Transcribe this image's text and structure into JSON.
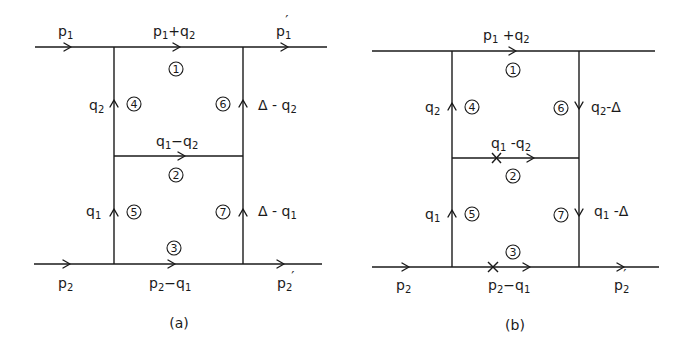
{
  "figure": {
    "type": "Feynman diagrams (two-loop ladder)",
    "panels": [
      {
        "id": "a",
        "caption": "(a)",
        "external_lines": {
          "top_in": {
            "base": "p",
            "sub": "1",
            "prime": ""
          },
          "top_out": {
            "base": "p",
            "sub": "1",
            "prime": "′"
          },
          "bottom_in": {
            "base": "p",
            "sub": "2",
            "prime": ""
          },
          "bottom_out": {
            "base": "p",
            "sub": "2",
            "prime": "′"
          }
        },
        "propagators": [
          {
            "number": "1",
            "label": "p₁+q₂",
            "direction": "right"
          },
          {
            "number": "2",
            "label": "q₁−q₂",
            "direction": "right"
          },
          {
            "number": "3",
            "label": "p₂−q₁",
            "direction": "right"
          },
          {
            "number": "4",
            "label": "q₂",
            "direction": "up"
          },
          {
            "number": "5",
            "label": "q₁",
            "direction": "up"
          },
          {
            "number": "6",
            "label": "Δ−q₂",
            "direction": "up"
          },
          {
            "number": "7",
            "label": "Δ−q₁",
            "direction": "up"
          }
        ],
        "labels": {
          "p1_base": "p",
          "p1_sub": "1",
          "p1p_base": "p",
          "p1p_sub": "1",
          "p1p_prime": "′",
          "top_mid_a": "p",
          "top_mid_a_sub": "1",
          "top_mid_op": "+q",
          "top_mid_b_sub": "2",
          "mid_a": "q",
          "mid_a_sub": "1",
          "mid_op": "−q",
          "mid_b_sub": "2",
          "bot_a": "p",
          "bot_a_sub": "2",
          "bot_op": "−q",
          "bot_b_sub": "1",
          "p2_base": "p",
          "p2_sub": "2",
          "p2p_base": "p",
          "p2p_sub": "2",
          "p2p_prime": "′",
          "left_top": "q",
          "left_top_sub": "2",
          "left_bot": "q",
          "left_bot_sub": "1",
          "right_top": "Δ - q",
          "right_top_sub": "2",
          "right_bot": "Δ - q",
          "right_bot_sub": "1"
        }
      },
      {
        "id": "b",
        "caption": "(b)",
        "cut_marks": [
          "propagator 2",
          "propagator 3"
        ],
        "propagators": [
          {
            "number": "1",
            "label": "p₁+q₂",
            "direction": "right"
          },
          {
            "number": "2",
            "label": "q₁−q₂",
            "direction": "right",
            "cut": true
          },
          {
            "number": "3",
            "label": "p₂−q₁",
            "direction": "right",
            "cut": true
          },
          {
            "number": "4",
            "label": "q₂",
            "direction": "up"
          },
          {
            "number": "5",
            "label": "q₁",
            "direction": "up"
          },
          {
            "number": "6",
            "label": "q₂−Δ",
            "direction": "down"
          },
          {
            "number": "7",
            "label": "q₁−Δ",
            "direction": "down"
          }
        ],
        "labels": {
          "top_mid_a": "p",
          "top_mid_a_sub": "1",
          "top_mid_op": " +q",
          "top_mid_b_sub": "2",
          "mid_a": "q",
          "mid_a_sub": "1",
          "mid_op": " -q",
          "mid_b_sub": "2",
          "bot_a": "p",
          "bot_a_sub": "2",
          "bot_op": "−q",
          "bot_b_sub": "1",
          "p2_base": "p",
          "p2_sub": "2",
          "p2p_base": "p",
          "p2p_sub": "2",
          "p2p_prime": "′",
          "left_top": "q",
          "left_top_sub": "2",
          "left_bot": "q",
          "left_bot_sub": "1",
          "right_top": "q",
          "right_top_sub": "2",
          "right_top_tail": "-Δ",
          "right_bot": "q",
          "right_bot_sub": "1",
          "right_bot_tail": " -Δ"
        }
      }
    ],
    "circle_numbers": [
      "1",
      "2",
      "3",
      "4",
      "5",
      "6",
      "7"
    ]
  }
}
